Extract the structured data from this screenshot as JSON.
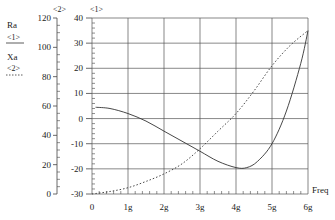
{
  "chart_data": {
    "type": "line",
    "title": "",
    "xlabel": "Freq",
    "x_ticks": [
      "0",
      "1g",
      "2g",
      "3g",
      "4g",
      "5g",
      "6g"
    ],
    "xlim": [
      0,
      6
    ],
    "axes": [
      {
        "id": "<1>",
        "ylim": [
          -30,
          40
        ],
        "ticks": [
          "40",
          "30",
          "20",
          "10",
          "0",
          "-10",
          "-20",
          "-30"
        ]
      },
      {
        "id": "<2>",
        "ylim": [
          0,
          120
        ],
        "ticks": [
          "120",
          "100",
          "80",
          "60",
          "40",
          "20",
          "0"
        ]
      }
    ],
    "grid": true,
    "legend": [
      {
        "name": "Ra",
        "axis": "<1>",
        "style": "solid"
      },
      {
        "name": "Xa",
        "axis": "<2>",
        "style": "dotted"
      }
    ],
    "series": [
      {
        "name": "Ra",
        "axis": "<1>",
        "style": "solid",
        "x": [
          0.1,
          0.5,
          1.0,
          1.5,
          2.0,
          2.5,
          3.0,
          3.5,
          4.0,
          4.3,
          4.6,
          5.0,
          5.4,
          5.8,
          6.0
        ],
        "y": [
          4.5,
          4,
          2,
          -1,
          -5,
          -9,
          -13,
          -17,
          -19.5,
          -19.5,
          -17,
          -10,
          3,
          22,
          35
        ]
      },
      {
        "name": "Xa",
        "axis": "<1>",
        "style": "dotted",
        "x": [
          0.0,
          0.5,
          1.0,
          1.5,
          2.0,
          2.5,
          3.0,
          3.5,
          4.0,
          4.5,
          5.0,
          5.5,
          6.0
        ],
        "y": [
          -30,
          -29,
          -27.5,
          -25,
          -22,
          -18,
          -12,
          -5,
          2,
          11,
          21,
          29,
          35
        ]
      }
    ]
  },
  "legend": {
    "ra_label": "Ra",
    "ra_axis": "<1>",
    "xa_label": "Xa",
    "xa_axis": "<2>"
  },
  "axis2_title": "<2>",
  "axis1_title": "<1>",
  "x_axis_label": "Freq"
}
